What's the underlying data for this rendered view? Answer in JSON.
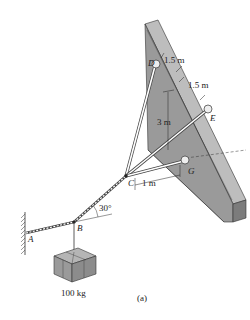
{
  "figure": {
    "caption": "(a)",
    "colors": {
      "wall_front": "#9a9a9a",
      "wall_top": "#bdbdbd",
      "wall_side": "#7c7c7c",
      "cable": "#ffffff",
      "ink": "#222222",
      "box": "#9e9e9e"
    }
  },
  "points": {
    "A": "A",
    "B": "B",
    "C": "C",
    "D": "D",
    "E": "E",
    "G": "G"
  },
  "dimensions": {
    "d_de_1": "1.5 m",
    "d_de_2": "1.5 m",
    "height": "3 m",
    "offset": "1 m",
    "angle": "30°"
  },
  "mass": {
    "label": "100 kg"
  }
}
